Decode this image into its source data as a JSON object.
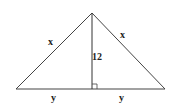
{
  "diagram": {
    "type": "isosceles-triangle-with-altitude",
    "labels": {
      "left_side": "x",
      "right_side": "x",
      "altitude": "12",
      "left_base": "y",
      "right_base": "y"
    },
    "right_angle_marker": true,
    "colors": {
      "stroke": "#333333",
      "background": "#ffffff"
    }
  }
}
